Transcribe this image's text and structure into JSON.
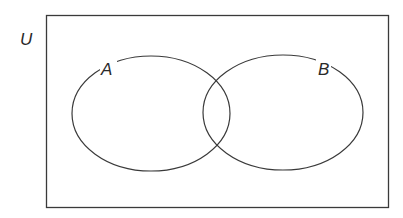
{
  "diagram": {
    "type": "venn",
    "universe": {
      "label": "U"
    },
    "sets": [
      {
        "label": "A"
      },
      {
        "label": "B"
      }
    ],
    "colors": {
      "stroke": "#3a3a3a",
      "background": "#ffffff"
    }
  }
}
